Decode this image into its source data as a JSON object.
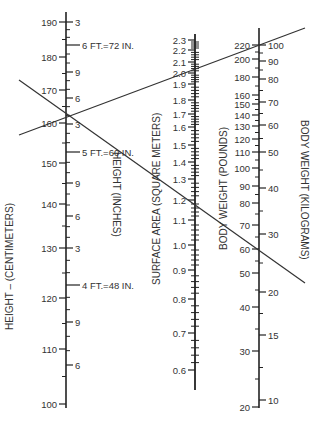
{
  "titles": {
    "height_cm": "HEIGHT – (CENTIMETERS)",
    "height_in": "HEIGHT (INCHES)",
    "surface_area": "SURFACE AREA (SQUARE METERS)",
    "weight_lb": "BODY WEIGHT (POUNDS)",
    "weight_kg": "BODY WEIGHT (KILOGRAMS)"
  },
  "height_scale": {
    "cm": [
      {
        "label": "190",
        "y": 22
      },
      {
        "label": "180",
        "y": 57
      },
      {
        "label": "170",
        "y": 90
      },
      {
        "label": "160",
        "y": 123
      },
      {
        "label": "150",
        "y": 163
      },
      {
        "label": "140",
        "y": 204
      },
      {
        "label": "130",
        "y": 248
      },
      {
        "label": "120",
        "y": 298
      },
      {
        "label": "110",
        "y": 349
      },
      {
        "label": "100",
        "y": 404
      }
    ],
    "inches": [
      {
        "label": "3",
        "y": 22
      },
      {
        "label": "6 FT.=72 IN.",
        "y": 45
      },
      {
        "label": "9",
        "y": 72
      },
      {
        "label": "6",
        "y": 98
      },
      {
        "label": "3",
        "y": 124
      },
      {
        "label": "5 FT.=60 IN.",
        "y": 152
      },
      {
        "label": "9",
        "y": 183
      },
      {
        "label": "6",
        "y": 216
      },
      {
        "label": "3",
        "y": 248
      },
      {
        "label": "4 FT.=48 IN.",
        "y": 285
      },
      {
        "label": "9",
        "y": 322
      },
      {
        "label": "6",
        "y": 365
      }
    ]
  },
  "surface_area_scale": [
    {
      "label": "2.3",
      "y": 40
    },
    {
      "label": "2.2",
      "y": 50
    },
    {
      "label": "2.1",
      "y": 62
    },
    {
      "label": "2.0",
      "y": 73
    },
    {
      "label": "1.9",
      "y": 84
    },
    {
      "label": "1.8",
      "y": 100
    },
    {
      "label": "1.7",
      "y": 114
    },
    {
      "label": "1.6",
      "y": 127
    },
    {
      "label": "1.5",
      "y": 145
    },
    {
      "label": "1.4",
      "y": 162
    },
    {
      "label": "1.3",
      "y": 179
    },
    {
      "label": "1.2",
      "y": 200
    },
    {
      "label": "1.1",
      "y": 220
    },
    {
      "label": "1.0",
      "y": 245
    },
    {
      "label": "0.9",
      "y": 270
    },
    {
      "label": "0.8",
      "y": 299
    },
    {
      "label": "0.7",
      "y": 333
    },
    {
      "label": "0.6",
      "y": 370
    }
  ],
  "weight_scale": {
    "pounds": [
      {
        "label": "220",
        "y": 45
      },
      {
        "label": "200",
        "y": 59
      },
      {
        "label": "180",
        "y": 77
      },
      {
        "label": "160",
        "y": 95
      },
      {
        "label": "150",
        "y": 104
      },
      {
        "label": "140",
        "y": 115
      },
      {
        "label": "130",
        "y": 126
      },
      {
        "label": "120",
        "y": 139
      },
      {
        "label": "110",
        "y": 152
      },
      {
        "label": "100",
        "y": 168
      },
      {
        "label": "90",
        "y": 186
      },
      {
        "label": "80",
        "y": 203
      },
      {
        "label": "70",
        "y": 225
      },
      {
        "label": "60",
        "y": 249
      },
      {
        "label": "50",
        "y": 273
      },
      {
        "label": "40",
        "y": 307
      },
      {
        "label": "30",
        "y": 351
      },
      {
        "label": "20",
        "y": 407
      }
    ],
    "kilograms": [
      {
        "label": "100",
        "y": 45
      },
      {
        "label": "90",
        "y": 61
      },
      {
        "label": "80",
        "y": 79
      },
      {
        "label": "70",
        "y": 102
      },
      {
        "label": "60",
        "y": 125
      },
      {
        "label": "50",
        "y": 152
      },
      {
        "label": "40",
        "y": 188
      },
      {
        "label": "30",
        "y": 234
      },
      {
        "label": "20",
        "y": 292
      },
      {
        "label": "15",
        "y": 335
      },
      {
        "label": "10",
        "y": 400
      }
    ]
  },
  "reading_lines": [
    {
      "name": "line-adult",
      "x1": 19,
      "y1": 135,
      "x2": 305,
      "y2": 28
    },
    {
      "name": "line-child",
      "x1": 19,
      "y1": 80,
      "x2": 305,
      "y2": 283
    }
  ]
}
